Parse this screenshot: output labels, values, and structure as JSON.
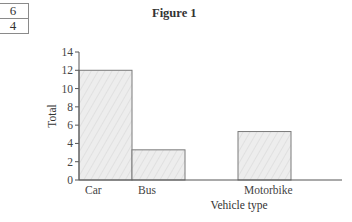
{
  "side_table": {
    "rows": [
      "6",
      "4"
    ]
  },
  "figure": {
    "title": "Figure 1"
  },
  "chart_data": {
    "type": "bar",
    "title": "Figure 1",
    "xlabel": "Vehicle type",
    "ylabel": "Total",
    "categories": [
      "Car",
      "Bus",
      "Motorbike"
    ],
    "category_positions": [
      0,
      1,
      3
    ],
    "values": [
      12,
      3.3,
      5.3
    ],
    "ylim": [
      0,
      14
    ],
    "yticks": [
      0,
      2,
      4,
      6,
      8,
      10,
      12,
      14
    ],
    "grid": false,
    "legend": null,
    "bar_fill": "#ececec",
    "bar_edge": "#7a7a7a"
  }
}
